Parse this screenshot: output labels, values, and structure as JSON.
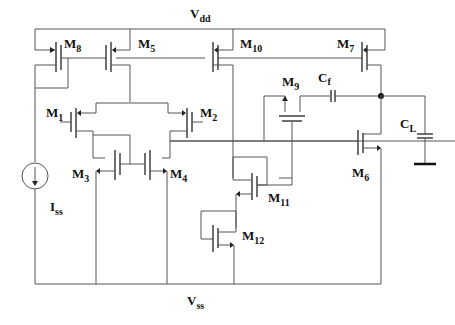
{
  "diagram": {
    "rails": {
      "top": {
        "main": "V",
        "sub": "dd"
      },
      "bottom": {
        "main": "V",
        "sub": "ss"
      }
    },
    "transistors": [
      {
        "id": "M8",
        "main": "M",
        "sub": "8",
        "type": "PMOS"
      },
      {
        "id": "M5",
        "main": "M",
        "sub": "5",
        "type": "PMOS"
      },
      {
        "id": "M10",
        "main": "M",
        "sub": "10",
        "type": "PMOS"
      },
      {
        "id": "M7",
        "main": "M",
        "sub": "7",
        "type": "PMOS"
      },
      {
        "id": "M1",
        "main": "M",
        "sub": "1",
        "type": "PMOS"
      },
      {
        "id": "M2",
        "main": "M",
        "sub": "2",
        "type": "PMOS"
      },
      {
        "id": "M3",
        "main": "M",
        "sub": "3",
        "type": "NMOS"
      },
      {
        "id": "M4",
        "main": "M",
        "sub": "4",
        "type": "NMOS"
      },
      {
        "id": "M9",
        "main": "M",
        "sub": "9",
        "type": "PMOS"
      },
      {
        "id": "M6",
        "main": "M",
        "sub": "6",
        "type": "NMOS"
      },
      {
        "id": "M11",
        "main": "M",
        "sub": "11",
        "type": "NMOS"
      },
      {
        "id": "M12",
        "main": "M",
        "sub": "12",
        "type": "NMOS"
      }
    ],
    "capacitors": [
      {
        "id": "Cf",
        "main": "C",
        "sub": "f"
      },
      {
        "id": "CL",
        "main": "C",
        "sub": "L"
      }
    ],
    "sources": [
      {
        "id": "Iss",
        "main": "I",
        "sub": "ss",
        "type": "current-source"
      }
    ]
  }
}
